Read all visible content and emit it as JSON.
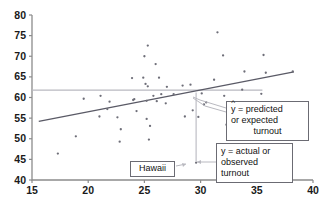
{
  "chart_data": {
    "type": "scatter",
    "title": "",
    "xlabel": "",
    "ylabel": "",
    "xlim": [
      15,
      40
    ],
    "ylim": [
      40,
      80
    ],
    "xticks": [
      15,
      20,
      25,
      30,
      35,
      40
    ],
    "yticks": [
      40,
      45,
      50,
      55,
      60,
      65,
      70,
      75,
      80
    ],
    "grid": false,
    "legend": "none",
    "points": [
      {
        "x": 17.3,
        "y": 46.4
      },
      {
        "x": 18.9,
        "y": 50.6
      },
      {
        "x": 19.6,
        "y": 59.7
      },
      {
        "x": 21.0,
        "y": 55.4
      },
      {
        "x": 21.1,
        "y": 60.4
      },
      {
        "x": 21.7,
        "y": 57.2
      },
      {
        "x": 21.9,
        "y": 59.0
      },
      {
        "x": 22.6,
        "y": 55.2
      },
      {
        "x": 22.8,
        "y": 49.3
      },
      {
        "x": 22.9,
        "y": 52.3
      },
      {
        "x": 23.9,
        "y": 64.7
      },
      {
        "x": 24.0,
        "y": 59.4
      },
      {
        "x": 24.1,
        "y": 59.6
      },
      {
        "x": 24.3,
        "y": 56.7
      },
      {
        "x": 24.9,
        "y": 64.8
      },
      {
        "x": 25.0,
        "y": 70.0
      },
      {
        "x": 25.1,
        "y": 63.3
      },
      {
        "x": 25.2,
        "y": 59.2
      },
      {
        "x": 25.2,
        "y": 54.8
      },
      {
        "x": 25.3,
        "y": 72.6
      },
      {
        "x": 25.3,
        "y": 62.7
      },
      {
        "x": 25.4,
        "y": 49.8
      },
      {
        "x": 25.5,
        "y": 53.1
      },
      {
        "x": 25.8,
        "y": 60.4
      },
      {
        "x": 26.0,
        "y": 68.1
      },
      {
        "x": 26.1,
        "y": 59.1
      },
      {
        "x": 26.3,
        "y": 64.8
      },
      {
        "x": 26.5,
        "y": 60.8
      },
      {
        "x": 26.9,
        "y": 58.6
      },
      {
        "x": 27.0,
        "y": 62.6
      },
      {
        "x": 27.6,
        "y": 60.8
      },
      {
        "x": 28.4,
        "y": 62.9
      },
      {
        "x": 28.6,
        "y": 55.4
      },
      {
        "x": 29.1,
        "y": 63.1
      },
      {
        "x": 29.3,
        "y": 56.9
      },
      {
        "x": 29.6,
        "y": 44.2
      },
      {
        "x": 29.8,
        "y": 55.3
      },
      {
        "x": 30.1,
        "y": 61.0
      },
      {
        "x": 30.3,
        "y": 58.3
      },
      {
        "x": 30.5,
        "y": 58.8
      },
      {
        "x": 31.2,
        "y": 64.3
      },
      {
        "x": 31.5,
        "y": 75.8
      },
      {
        "x": 32.0,
        "y": 70.2
      },
      {
        "x": 32.1,
        "y": 60.4
      },
      {
        "x": 32.3,
        "y": 53.4
      },
      {
        "x": 33.7,
        "y": 61.9
      },
      {
        "x": 33.9,
        "y": 66.3
      },
      {
        "x": 35.4,
        "y": 60.9
      },
      {
        "x": 35.6,
        "y": 70.3
      },
      {
        "x": 35.8,
        "y": 66.0
      },
      {
        "x": 38.2,
        "y": 66.3
      }
    ],
    "regression_line": {
      "x1": 15.6,
      "y1": 54.2,
      "x2": 38.3,
      "y2": 66.2
    },
    "reference_line": {
      "y": 61.8,
      "x1": 15.0,
      "x2": 35.5
    },
    "residual_segment": {
      "x": 29.6,
      "y_top": 61.2,
      "y_bottom": 44.6
    },
    "highlighted_point": {
      "x": 29.6,
      "y": 44.2,
      "label": "Hawaii"
    }
  },
  "annotations": {
    "predicted": {
      "symbol": "y",
      "hat": "^",
      "line1_rest": " = predicted",
      "line2": "or expected",
      "line3": "turnout"
    },
    "actual": {
      "line1": "y = actual or",
      "line2": "observed",
      "line3": "turnout"
    },
    "hawaii": {
      "label": "Hawaii"
    }
  },
  "colors": {
    "point": "#6e6e78",
    "regression": "#5a5a66",
    "reference": "#b9b9c0",
    "axis": "#8c8c8c",
    "callout_border": "#6b6b73",
    "text": "#111111",
    "background": "#ffffff"
  }
}
